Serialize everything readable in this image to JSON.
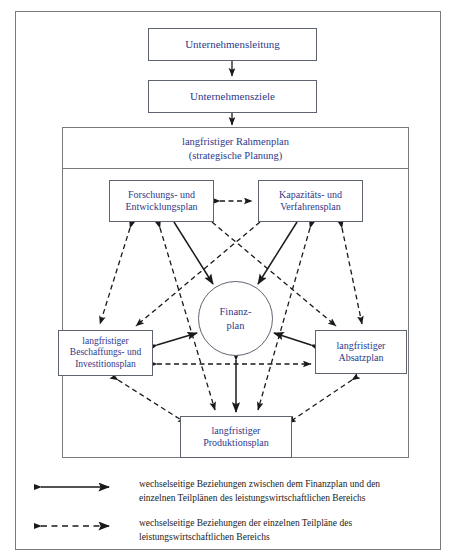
{
  "diagram": {
    "text_color": "#2e3a8c",
    "line_color": "#5d6470",
    "frame_color": "#7a7a7a",
    "nodes": {
      "unternehmensleitung": "Unternehmensleitung",
      "unternehmensziele": "Unternehmensziele",
      "rahmenplan": "langfristiger Rahmenplan\n(strategische Planung)",
      "forschung": "Forschungs- und\nEntwicklungsplan",
      "kapazitaet": "Kapazitäts- und\nVerfahrensplan",
      "beschaffung": "langfristiger\nBeschaffungs- und\nInvestitionsplan",
      "absatz": "langfristiger\nAbsatzplan",
      "produktion": "langfristiger\nProduktionsplan",
      "finanzplan": "Finanz-\nplan"
    }
  },
  "legend": {
    "items": [
      {
        "style": "solid",
        "icon": "double-arrow-solid-icon",
        "text": "wechselseitige Beziehungen zwischen dem Finanzplan und den\neinzelnen Teilplänen des leistungswirtschaftlichen Bereichs"
      },
      {
        "style": "dashed",
        "icon": "double-arrow-dashed-icon",
        "text": "wechselseitige Beziehungen der einzelnen Teilpläne des\nleistungswirtschaftlichen Bereichs"
      }
    ]
  }
}
